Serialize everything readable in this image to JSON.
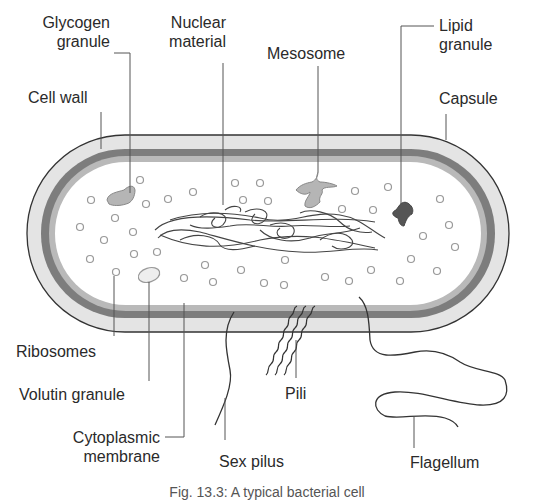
{
  "figure": {
    "caption": "Fig. 13.3: A typical bacterial cell",
    "colors": {
      "capsule": "#e4e4e4",
      "cell_wall": "#7d7d7d",
      "membrane": "#b9b9b9",
      "cytoplasm": "#ffffff",
      "outline": "#333333",
      "glycogen": "#b5b5b5",
      "lipid": "#555555",
      "volutin": "#e8e8e8"
    }
  },
  "labels": {
    "glycogen_granule": [
      "Glycogen",
      "granule"
    ],
    "nuclear_material": [
      "Nuclear",
      "material"
    ],
    "mesosome": "Mesosome",
    "lipid_granule": [
      "Lipid",
      "granule"
    ],
    "cell_wall": "Cell wall",
    "capsule": "Capsule",
    "ribosomes": "Ribosomes",
    "volutin_granule": "Volutin granule",
    "cytoplasmic_membrane": [
      "Cytoplasmic",
      "membrane"
    ],
    "pili": "Pili",
    "sex_pilus": "Sex pilus",
    "flagellum": "Flagellum"
  }
}
